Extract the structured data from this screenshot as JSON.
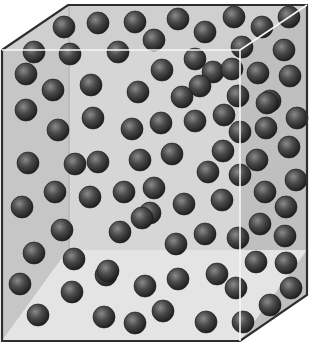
{
  "figure": {
    "colors": {
      "background": "#ffffff",
      "back_wall": "#d4d4d4",
      "left_wall": "#c4c4c4",
      "right_wall": "#bdbdbd",
      "floor": "#e2e2e2",
      "outline": "#333333",
      "front_edge": "#f4f4f4",
      "sphere_dark": "#1e1e1e",
      "sphere_mid": "#4a4a4a",
      "sphere_highlight": "#8a8a8a"
    },
    "box": {
      "outer_polygon": [
        [
          2,
          50
        ],
        [
          68,
          5
        ],
        [
          307,
          5
        ],
        [
          307,
          295
        ],
        [
          240,
          341
        ],
        [
          2,
          341
        ]
      ],
      "front_face": {
        "x": 2,
        "y": 50,
        "width": 238,
        "height": 291
      },
      "back_face": {
        "x": 68,
        "y": 5,
        "width": 239,
        "height": 245
      }
    },
    "sphere_radius": 11,
    "spheres": [
      [
        64,
        27
      ],
      [
        98,
        23
      ],
      [
        34,
        52
      ],
      [
        70,
        54
      ],
      [
        26,
        74
      ],
      [
        53,
        90
      ],
      [
        91,
        85
      ],
      [
        26,
        110
      ],
      [
        93,
        118
      ],
      [
        135,
        22
      ],
      [
        178,
        19
      ],
      [
        154,
        40
      ],
      [
        205,
        32
      ],
      [
        118,
        52
      ],
      [
        195,
        59
      ],
      [
        162,
        70
      ],
      [
        213,
        72
      ],
      [
        138,
        92
      ],
      [
        200,
        86
      ],
      [
        182,
        97
      ],
      [
        234,
        17
      ],
      [
        289,
        17
      ],
      [
        262,
        27
      ],
      [
        242,
        47
      ],
      [
        284,
        50
      ],
      [
        232,
        69
      ],
      [
        290,
        76
      ],
      [
        258,
        73
      ],
      [
        238,
        96
      ],
      [
        270,
        101
      ],
      [
        58,
        130
      ],
      [
        28,
        163
      ],
      [
        75,
        164
      ],
      [
        55,
        192
      ],
      [
        22,
        207
      ],
      [
        90,
        197
      ],
      [
        132,
        129
      ],
      [
        161,
        123
      ],
      [
        195,
        121
      ],
      [
        98,
        162
      ],
      [
        140,
        160
      ],
      [
        172,
        154
      ],
      [
        208,
        172
      ],
      [
        124,
        192
      ],
      [
        154,
        188
      ],
      [
        184,
        204
      ],
      [
        150,
        213
      ],
      [
        224,
        115
      ],
      [
        267,
        103
      ],
      [
        297,
        118
      ],
      [
        240,
        132
      ],
      [
        266,
        128
      ],
      [
        223,
        151
      ],
      [
        257,
        160
      ],
      [
        289,
        147
      ],
      [
        240,
        175
      ],
      [
        265,
        192
      ],
      [
        296,
        180
      ],
      [
        222,
        200
      ],
      [
        286,
        207
      ],
      [
        62,
        230
      ],
      [
        34,
        253
      ],
      [
        74,
        259
      ],
      [
        20,
        284
      ],
      [
        72,
        292
      ],
      [
        38,
        315
      ],
      [
        104,
        317
      ],
      [
        106,
        275
      ],
      [
        120,
        232
      ],
      [
        142,
        218
      ],
      [
        176,
        244
      ],
      [
        108,
        271
      ],
      [
        145,
        286
      ],
      [
        178,
        279
      ],
      [
        205,
        234
      ],
      [
        217,
        274
      ],
      [
        135,
        323
      ],
      [
        163,
        311
      ],
      [
        206,
        322
      ],
      [
        238,
        238
      ],
      [
        260,
        224
      ],
      [
        285,
        236
      ],
      [
        256,
        262
      ],
      [
        286,
        263
      ],
      [
        236,
        288
      ],
      [
        270,
        305
      ],
      [
        291,
        288
      ],
      [
        243,
        322
      ]
    ]
  }
}
